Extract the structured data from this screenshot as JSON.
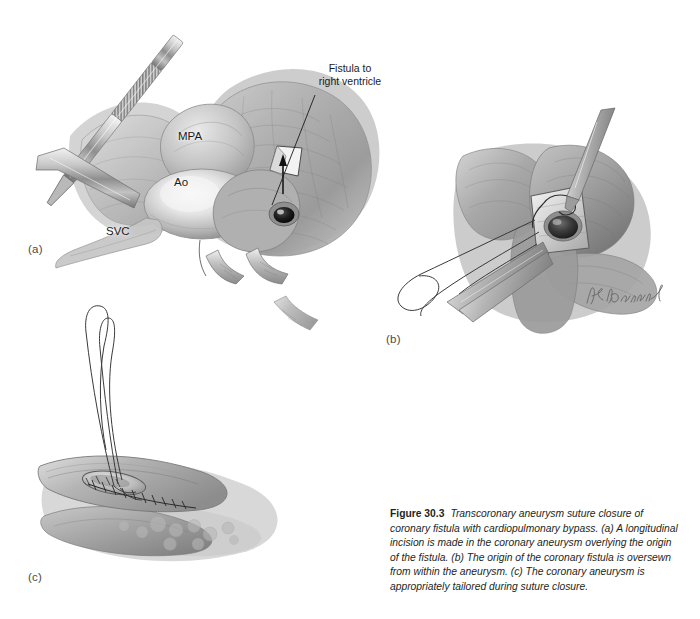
{
  "figure": {
    "number": "Figure 30.3",
    "caption": "Transcoronary aneurysm suture closure of coronary fistula with cardiopulmonary bypass. (a) A longitudinal incision is made in the coronary aneurysm overlying the origin of the fistula. (b) The origin of the coronary fistula is oversewn from within the aneurysm. (c) The coronary aneurysm is appropriately tailored during suture closure.",
    "background_color": "#ffffff",
    "ink_color": "#231f20"
  },
  "panels": [
    {
      "id": "a",
      "label": "(a)",
      "description": "Operative view of the heart on cardiopulmonary bypass; forceps retract tissue while a longitudinal incision is made in the coronary aneurysm overlying the fistula origin.",
      "labels": [
        {
          "name": "mpa",
          "text": "MPA"
        },
        {
          "name": "ao",
          "text": "Ao"
        },
        {
          "name": "svc",
          "text": "SVC"
        }
      ],
      "callouts": [
        {
          "name": "fistula-to-right-ventricle",
          "text": "Fistula to\nright ventricle"
        }
      ]
    },
    {
      "id": "b",
      "label": "(b)",
      "description": "Close-up of the opened aneurysm; the fistula orifice is oversewn from within using sutures held by forceps.",
      "labels": [],
      "callouts": []
    },
    {
      "id": "c",
      "label": "(c)",
      "description": "The coronary aneurysm is tailored and closed with a running suture line; the suture loop extends upward.",
      "labels": [],
      "callouts": []
    }
  ],
  "artist_signature": {
    "name": "artist-signature",
    "legible": false
  }
}
